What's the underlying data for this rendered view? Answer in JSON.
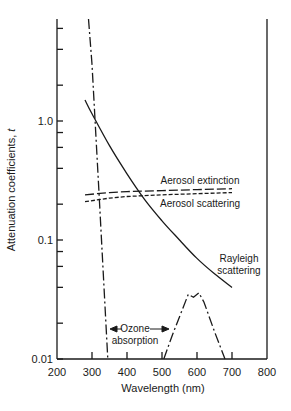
{
  "chart_data": {
    "type": "line",
    "title": "",
    "xlabel": "Wavelength (nm)",
    "ylabel": "Attenuation coefficients, t",
    "xlim": [
      200,
      800
    ],
    "ylim": [
      0.01,
      7.2
    ],
    "yscale": "log",
    "grid": false,
    "legend_position": "inline annotations",
    "x_ticks": [
      200,
      300,
      400,
      500,
      600,
      700,
      800
    ],
    "x_tick_labels": [
      "200",
      "300",
      "400",
      "500",
      "600",
      "700",
      "800"
    ],
    "y_ticks_labeled": [
      0.01,
      0.1,
      1.0
    ],
    "y_tick_labels": [
      "0.01",
      "0.1",
      "1.0"
    ],
    "y_minor_ticks": [
      0.02,
      0.04,
      0.06,
      0.08,
      0.2,
      0.4,
      0.6,
      0.8,
      2,
      4,
      6
    ],
    "series": [
      {
        "name": "Rayleigh scattering",
        "style": "solid",
        "x": [
          280,
          300,
          350,
          400,
          450,
          500,
          550,
          600,
          650,
          700
        ],
        "y": [
          1.5,
          1.15,
          0.62,
          0.36,
          0.22,
          0.145,
          0.1,
          0.07,
          0.052,
          0.04
        ]
      },
      {
        "name": "Aerosol extinction",
        "style": "long-dash",
        "x": [
          280,
          350,
          400,
          500,
          600,
          700
        ],
        "y": [
          0.24,
          0.25,
          0.255,
          0.26,
          0.265,
          0.27
        ]
      },
      {
        "name": "Aerosol scattering",
        "style": "short-dash",
        "x": [
          280,
          350,
          400,
          500,
          600,
          700
        ],
        "y": [
          0.21,
          0.225,
          0.232,
          0.24,
          0.245,
          0.25
        ]
      },
      {
        "name": "Ozone absorption (UV, Hartley-Huggins)",
        "style": "dash-dot",
        "x": [
          290,
          300,
          320,
          345
        ],
        "y": [
          7.2,
          3.0,
          0.25,
          0.01
        ]
      },
      {
        "name": "Ozone absorption (Chappuis band)",
        "style": "dash-dot",
        "x": [
          505,
          530,
          575,
          590,
          605,
          620,
          650,
          680
        ],
        "y": [
          0.01,
          0.016,
          0.035,
          0.033,
          0.036,
          0.03,
          0.017,
          0.01
        ]
      }
    ],
    "annotations": [
      {
        "text": "Aerosol extinction",
        "x": 560,
        "y": 0.29
      },
      {
        "text": "Aerosol scattering",
        "x": 560,
        "y": 0.21
      },
      {
        "text": "Rayleigh",
        "x": 680,
        "y": 0.075
      },
      {
        "text": "scattering",
        "x": 680,
        "y": 0.06
      },
      {
        "text": "Ozone",
        "x": 420,
        "y": 0.0155
      },
      {
        "text": "absorption",
        "x": 420,
        "y": 0.012
      }
    ]
  },
  "labels": {
    "x_axis_title": "Wavelength (nm)",
    "y_axis_title_main": "Attenuation coefficients, ",
    "y_axis_title_var": "t",
    "aerosol_extinction": "Aerosol extinction",
    "aerosol_scattering": "Aerosol scattering",
    "rayleigh_line1": "Rayleigh",
    "rayleigh_line2": "scattering",
    "ozone_line1": "Ozone",
    "ozone_line2": "absorption"
  }
}
